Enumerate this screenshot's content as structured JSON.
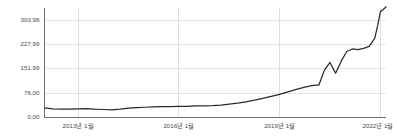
{
  "chart_data": {
    "type": "line",
    "title": "",
    "subtitle": "",
    "xlabel": "",
    "ylabel": "",
    "grid": true,
    "legend": false,
    "legend_position": "none",
    "line_color": "#2b2b2b",
    "grid_color": "#d9d9d9",
    "axis_color": "#6e6e6e",
    "ylim": [
      0,
      341.98
    ],
    "yticks": [
      0,
      76.0,
      151.99,
      227.99,
      303.98
    ],
    "ytick_labels": [
      "0,00",
      "76,00",
      "151,99",
      "227,99",
      "303,98"
    ],
    "xlim": [
      "2012-01",
      "2022-03"
    ],
    "xticks": [
      "2013-01",
      "2016-01",
      "2019-01",
      "2022-01"
    ],
    "xtick_labels": [
      "2013년 1월",
      "2016년 1월",
      "2019년 1월",
      "2022년 1월"
    ],
    "series": [
      {
        "name": "value",
        "x": [
          "2012-01",
          "2012-04",
          "2012-07",
          "2012-10",
          "2013-01",
          "2013-04",
          "2013-07",
          "2013-10",
          "2014-01",
          "2014-04",
          "2014-07",
          "2014-10",
          "2015-01",
          "2015-04",
          "2015-07",
          "2015-10",
          "2016-01",
          "2016-04",
          "2016-07",
          "2016-10",
          "2017-01",
          "2017-04",
          "2017-07",
          "2017-10",
          "2018-01",
          "2018-04",
          "2018-07",
          "2018-10",
          "2019-01",
          "2019-04",
          "2019-07",
          "2019-10",
          "2020-01",
          "2020-02",
          "2020-03",
          "2020-05",
          "2020-07",
          "2020-09",
          "2020-11",
          "2021-01",
          "2021-03",
          "2021-05",
          "2021-07",
          "2021-09",
          "2021-11",
          "2021-12",
          "2022-01",
          "2022-03"
        ],
        "values": [
          30,
          27,
          26,
          26,
          27,
          28,
          26,
          25,
          24,
          26,
          29,
          31,
          32,
          33,
          34,
          34,
          35,
          35,
          36,
          36,
          37,
          39,
          42,
          45,
          49,
          54,
          60,
          66,
          72,
          80,
          88,
          95,
          100,
          101,
          101,
          148,
          172,
          138,
          176,
          206,
          214,
          212,
          216,
          222,
          248,
          286,
          330,
          345
        ]
      }
    ]
  }
}
